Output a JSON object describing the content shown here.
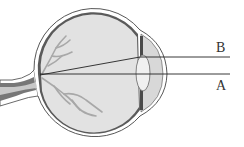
{
  "diagram": {
    "type": "eye-cross-section",
    "labels": {
      "ray_b": "B",
      "ray_a": "A"
    },
    "colors": {
      "background": "#ffffff",
      "outline": "#333333",
      "sclera_dark": "#555555",
      "vitreous": "#e2e2e2",
      "vessels": "#a8a8a8",
      "lens": "#f0f0f0",
      "cornea_fill": "#d8d8d8"
    }
  }
}
